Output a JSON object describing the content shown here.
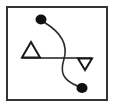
{
  "figure": {
    "canvas": {
      "width": 115,
      "height": 108
    },
    "background_color": "#ffffff",
    "frame": {
      "name": "outer-frame",
      "x": 6,
      "y": 6,
      "width": 102,
      "height": 95,
      "stroke_color": "#333333",
      "stroke_width": 2,
      "fill_color": "#ffffff"
    },
    "horizontal_line": {
      "name": "horizontal-axis-line",
      "x1": 22,
      "y1": 58,
      "x2": 92,
      "y2": 58,
      "stroke_color": "#555555",
      "stroke_width": 2
    },
    "markers": [
      {
        "name": "up-triangle-marker",
        "shape": "triangle-up",
        "points": "31,42 40,57.5 22,57.5",
        "fill": "none",
        "stroke_color": "#1a1a1a",
        "stroke_width": 2
      },
      {
        "name": "down-triangle-marker",
        "shape": "triangle-down",
        "points": "78,58.5 92,58.5 85,70",
        "fill": "none",
        "stroke_color": "#1a1a1a",
        "stroke_width": 2
      },
      {
        "name": "upper-dot-marker",
        "shape": "ellipse-filled",
        "cx": 41,
        "cy": 19.5,
        "rx": 5.5,
        "ry": 5,
        "fill_color": "#101010"
      },
      {
        "name": "lower-dot-marker",
        "shape": "ellipse-filled",
        "cx": 82,
        "cy": 88,
        "rx": 5.5,
        "ry": 5,
        "fill_color": "#101010"
      }
    ],
    "curve": {
      "name": "s-curve-connector",
      "path": "M 44.5 22.5 C 62 33 68 45 64 59 C 60 72 62 80 78.5 86.5",
      "stroke_color": "#2b2b2b",
      "stroke_width": 1.6,
      "fill": "none"
    }
  }
}
